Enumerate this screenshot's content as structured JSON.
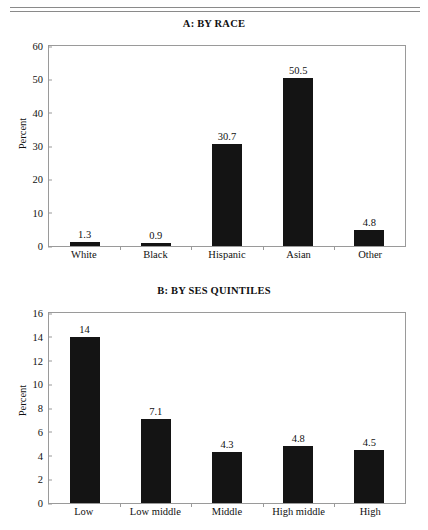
{
  "page": {
    "rules": [
      "divider-top",
      "divider-bottom"
    ]
  },
  "chart_data": [
    {
      "type": "bar",
      "panel": "A",
      "title": "A: BY RACE",
      "xlabel": "",
      "ylabel": "Percent",
      "categories": [
        "White",
        "Black",
        "Hispanic",
        "Asian",
        "Other"
      ],
      "values": [
        1.3,
        0.9,
        30.7,
        50.5,
        4.8
      ],
      "value_labels": [
        "1.3",
        "0.9",
        "30.7",
        "50.5",
        "4.8"
      ],
      "ylim": [
        0,
        60
      ],
      "yticks": [
        60,
        50,
        40,
        30,
        20,
        10,
        0
      ],
      "ytick_labels": [
        "60",
        "50",
        "40",
        "30",
        "20",
        "10",
        "0"
      ],
      "grid": false,
      "legend": "none",
      "bar_color": "#141414"
    },
    {
      "type": "bar",
      "panel": "B",
      "title": "B: BY SES QUINTILES",
      "xlabel": "",
      "ylabel": "Percent",
      "categories": [
        "Low",
        "Low middle",
        "Middle",
        "High middle",
        "High"
      ],
      "values": [
        14,
        7.1,
        4.3,
        4.8,
        4.5
      ],
      "value_labels": [
        "14",
        "7.1",
        "4.3",
        "4.8",
        "4.5"
      ],
      "ylim": [
        0,
        16
      ],
      "yticks": [
        16,
        14,
        12,
        10,
        8,
        6,
        4,
        2,
        0
      ],
      "ytick_labels": [
        "16",
        "14",
        "12",
        "10",
        "8",
        "6",
        "4",
        "2",
        "0"
      ],
      "grid": false,
      "legend": "none",
      "bar_color": "#141414"
    }
  ]
}
